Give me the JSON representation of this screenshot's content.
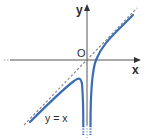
{
  "figure": {
    "type": "function-graph",
    "labels": {
      "y_axis": "y",
      "x_axis": "x",
      "origin": "O",
      "asymptote": "y = x"
    },
    "colors": {
      "curve": "#3a6db3",
      "asymptote": "#8a8a8a",
      "axes": "#555555",
      "text": "#2b2b2b"
    },
    "elements": [
      {
        "name": "x-axis",
        "style": "solid with arrow",
        "dotted_left_end": true
      },
      {
        "name": "y-axis",
        "style": "solid with arrow",
        "dotted_bottom_end": true
      },
      {
        "name": "oblique-asymptote",
        "equation": "y = x",
        "style": "dashed"
      },
      {
        "name": "vertical-asymptote",
        "equation": "x = 0",
        "note": "curve branches descend on both sides of the y-axis"
      },
      {
        "name": "curve-right-branch",
        "description": "rises from -infinity near x=0+, crosses the x-axis just right of O, approaches y = x from below"
      },
      {
        "name": "curve-left-branch",
        "description": "approaches y = x from below as x -> -infinity, reaches a local maximum left of the y-axis, then descends to -infinity as x -> 0-"
      }
    ]
  }
}
